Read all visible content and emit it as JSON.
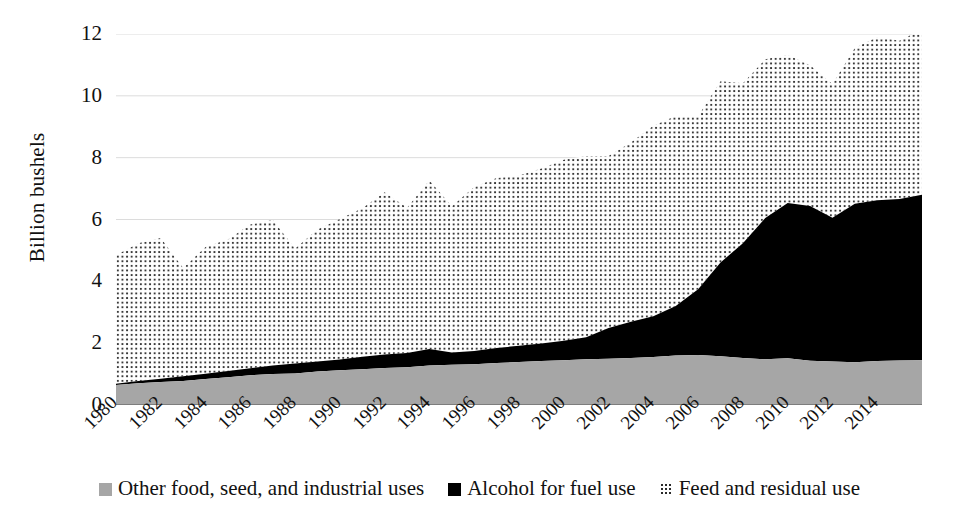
{
  "chart_data": {
    "type": "area",
    "stacked": true,
    "title": "",
    "xlabel": "",
    "ylabel": "Billion bushels",
    "ylim": [
      0,
      12
    ],
    "ytick_labels": [
      "0",
      "2",
      "4",
      "6",
      "8",
      "10",
      "12"
    ],
    "ytick_values": [
      0,
      2,
      4,
      6,
      8,
      10,
      12
    ],
    "grid": true,
    "grid_axis": "y",
    "legend_position": "bottom",
    "x": [
      1980,
      1981,
      1982,
      1983,
      1984,
      1985,
      1986,
      1987,
      1988,
      1989,
      1990,
      1991,
      1992,
      1993,
      1994,
      1995,
      1996,
      1997,
      1998,
      1999,
      2000,
      2001,
      2002,
      2003,
      2004,
      2005,
      2006,
      2007,
      2008,
      2009,
      2010,
      2011,
      2012,
      2013,
      2014,
      2015,
      2016
    ],
    "xtick_labels": [
      "1980",
      "1982",
      "1984",
      "1986",
      "1988",
      "1990",
      "1992",
      "1994",
      "1996",
      "1998",
      "2000",
      "2002",
      "2004",
      "2006",
      "2008",
      "2010",
      "2012",
      "2014"
    ],
    "xtick_values": [
      1980,
      1982,
      1984,
      1986,
      1988,
      1990,
      1992,
      1994,
      1996,
      1998,
      2000,
      2002,
      2004,
      2006,
      2008,
      2010,
      2012,
      2014
    ],
    "series": [
      {
        "name": "Other food, seed, and industrial uses",
        "color": "#a6a6a6",
        "pattern": "solid-gray",
        "values": [
          0.65,
          0.7,
          0.74,
          0.78,
          0.84,
          0.9,
          0.96,
          1.0,
          1.02,
          1.08,
          1.12,
          1.16,
          1.2,
          1.22,
          1.28,
          1.3,
          1.32,
          1.36,
          1.39,
          1.42,
          1.45,
          1.48,
          1.5,
          1.52,
          1.55,
          1.6,
          1.62,
          1.58,
          1.52,
          1.48,
          1.51,
          1.43,
          1.41,
          1.38,
          1.42,
          1.44,
          1.45
        ]
      },
      {
        "name": "Alcohol for fuel use",
        "color": "#000000",
        "pattern": "solid-black",
        "values": [
          0.04,
          0.08,
          0.11,
          0.15,
          0.17,
          0.2,
          0.23,
          0.28,
          0.32,
          0.33,
          0.35,
          0.4,
          0.43,
          0.46,
          0.53,
          0.4,
          0.43,
          0.48,
          0.53,
          0.57,
          0.63,
          0.71,
          0.99,
          1.17,
          1.32,
          1.6,
          2.12,
          3.03,
          3.71,
          4.57,
          5.02,
          5.01,
          4.65,
          5.13,
          5.2,
          5.22,
          5.35
        ]
      },
      {
        "name": "Feed and residual use",
        "color": "#ffffff",
        "pattern": "dotted",
        "values": [
          4.15,
          4.45,
          4.55,
          3.5,
          4.1,
          4.25,
          4.65,
          4.7,
          3.72,
          4.27,
          4.55,
          4.8,
          5.25,
          4.7,
          5.45,
          4.73,
          5.3,
          5.5,
          5.5,
          5.66,
          5.85,
          5.86,
          5.56,
          5.8,
          6.16,
          6.15,
          5.6,
          5.86,
          5.18,
          5.13,
          4.79,
          4.55,
          4.32,
          5.04,
          5.28,
          5.12,
          5.35
        ]
      }
    ],
    "totals": [
      4.84,
      5.23,
      5.4,
      4.43,
      5.11,
      5.35,
      5.84,
      5.98,
      5.06,
      5.68,
      6.02,
      6.36,
      6.88,
      6.38,
      7.26,
      6.43,
      7.05,
      7.34,
      7.42,
      7.65,
      7.93,
      8.05,
      8.05,
      8.49,
      9.03,
      9.35,
      9.34,
      10.47,
      10.41,
      11.18,
      11.32,
      10.99,
      10.38,
      11.55,
      11.9,
      11.78,
      12.15
    ]
  },
  "axis": {
    "y_title": "Billion bushels"
  },
  "legend": {
    "items": [
      {
        "label": "Other food, seed, and industrial uses",
        "swatch": "gray"
      },
      {
        "label": "Alcohol for fuel use",
        "swatch": "black"
      },
      {
        "label": "Feed and residual use",
        "swatch": "dotted"
      }
    ]
  }
}
